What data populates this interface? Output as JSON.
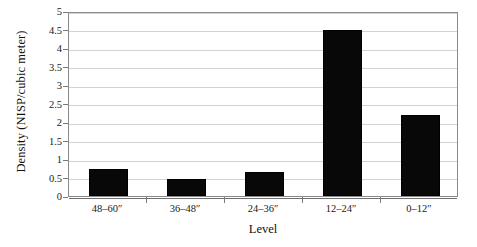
{
  "chart_data": {
    "type": "bar",
    "title": "",
    "xlabel": "Level",
    "ylabel": "Density (NISP/cubic meter)",
    "categories": [
      "48–60″",
      "36–48″",
      "24–36″",
      "12–24″",
      "0–12″"
    ],
    "values": [
      0.73,
      0.45,
      0.65,
      4.5,
      2.2
    ],
    "ylim": [
      0,
      5
    ],
    "ytick_values": [
      0,
      0.5,
      1,
      1.5,
      2,
      2.5,
      3,
      3.5,
      4,
      4.5,
      5
    ],
    "ytick_labels": [
      "0",
      "0.5",
      "1",
      "1.5",
      "2",
      "2.5",
      "3",
      "3.5",
      "4",
      "4.5",
      "5"
    ],
    "grid": true,
    "legend": false,
    "bar_color": "#080808",
    "grid_color": "#d2d2d2",
    "axis_color": "#8a8a8a"
  }
}
